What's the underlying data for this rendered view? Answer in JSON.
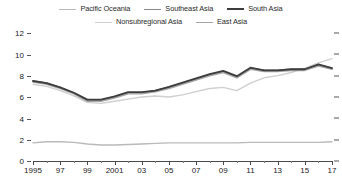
{
  "legend": {
    "rows": [
      [
        {
          "label": "Pacific Oceania",
          "color": "#b9b9b9",
          "width": 1.4
        },
        {
          "label": "Southeast Asia",
          "color": "#8a8a8a",
          "width": 1.6
        },
        {
          "label": "South Asia",
          "color": "#3d3d3d",
          "width": 2.0
        }
      ],
      [
        {
          "label": "Nonsubregional Asia",
          "color": "#cfcfcf",
          "width": 1.4
        },
        {
          "label": "East Asia",
          "color": "#a5a5a5",
          "width": 1.6
        }
      ]
    ]
  },
  "axes": {
    "y_ticks": [
      "12",
      "10",
      "8",
      "6",
      "4",
      "2",
      "0"
    ],
    "x_ticks": [
      "1995",
      "97",
      "99",
      "2001",
      "03",
      "05",
      "07",
      "09",
      "11",
      "13",
      "15",
      "17"
    ]
  },
  "chart_data": {
    "type": "line",
    "title": "",
    "subtitle": "",
    "xlabel": "",
    "ylabel": "",
    "xlim": [
      1995,
      2017
    ],
    "ylim": [
      0,
      12
    ],
    "grid": false,
    "legend_position": "top",
    "x": [
      1995,
      1996,
      1997,
      1998,
      1999,
      2000,
      2001,
      2002,
      2003,
      2004,
      2005,
      2006,
      2007,
      2008,
      2009,
      2010,
      2011,
      2012,
      2013,
      2014,
      2015,
      2016,
      2017
    ],
    "x_tick_labels": [
      "1995",
      "97",
      "99",
      "2001",
      "03",
      "05",
      "07",
      "09",
      "11",
      "13",
      "15",
      "17"
    ],
    "y_tick_labels": [
      "0",
      "2",
      "4",
      "6",
      "8",
      "10",
      "12"
    ],
    "series": [
      {
        "name": "Pacific Oceania",
        "color": "#b9b9b9",
        "width": 1.4,
        "values": [
          1.7,
          1.8,
          1.8,
          1.75,
          1.6,
          1.5,
          1.5,
          1.55,
          1.6,
          1.65,
          1.7,
          1.7,
          1.7,
          1.7,
          1.7,
          1.7,
          1.75,
          1.75,
          1.75,
          1.75,
          1.75,
          1.75,
          1.8
        ]
      },
      {
        "name": "Nonsubregional Asia",
        "color": "#cfcfcf",
        "width": 1.4,
        "values": [
          7.2,
          7.0,
          6.6,
          6.1,
          5.5,
          5.4,
          5.6,
          5.8,
          6.0,
          6.1,
          6.0,
          6.2,
          6.5,
          6.8,
          6.9,
          6.6,
          7.3,
          7.8,
          8.0,
          8.3,
          8.7,
          9.2,
          9.6
        ]
      },
      {
        "name": "Southeast Asia",
        "color": "#8a8a8a",
        "width": 1.6,
        "values": [
          7.5,
          7.3,
          6.9,
          6.4,
          5.7,
          5.7,
          6.0,
          6.4,
          6.4,
          6.6,
          6.9,
          7.3,
          7.7,
          8.1,
          8.4,
          7.9,
          8.7,
          8.5,
          8.5,
          8.6,
          8.6,
          9.0,
          8.7
        ]
      },
      {
        "name": "East Asia",
        "color": "#a5a5a5",
        "width": 1.6,
        "values": [
          7.4,
          7.2,
          6.8,
          6.3,
          5.6,
          5.6,
          5.9,
          6.3,
          6.3,
          6.5,
          6.8,
          7.2,
          7.6,
          8.0,
          8.3,
          7.8,
          8.6,
          8.4,
          8.4,
          8.5,
          8.5,
          8.9,
          8.6
        ]
      },
      {
        "name": "South Asia",
        "color": "#3d3d3d",
        "width": 1.8,
        "values": [
          7.5,
          7.3,
          6.9,
          6.4,
          5.75,
          5.75,
          6.05,
          6.45,
          6.45,
          6.6,
          6.95,
          7.35,
          7.75,
          8.15,
          8.45,
          7.95,
          8.75,
          8.5,
          8.5,
          8.6,
          8.6,
          9.05,
          8.7
        ]
      }
    ]
  }
}
